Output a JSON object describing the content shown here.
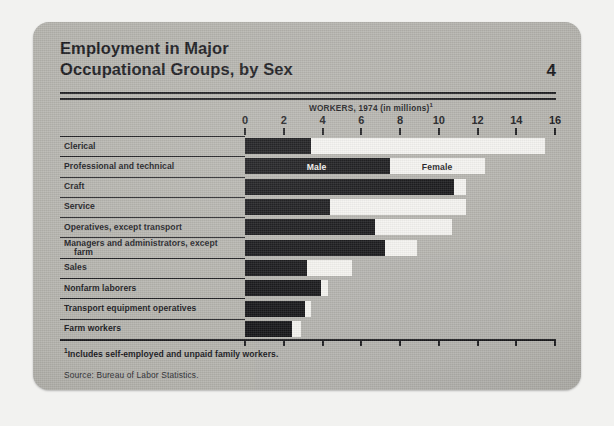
{
  "card": {
    "title_line_1": "Employment in Major",
    "title_line_2": "Occupational Groups, by Sex",
    "page_number": "4",
    "axis_title": "WORKERS, 1974 (in millions)",
    "axis_title_footnote_marker": "1",
    "footnote_marker": "1",
    "footnote": "Includes self-employed and unpaid family workers.",
    "source": "Source:  Bureau of Labor Statistics."
  },
  "colors": {
    "card_background": "#b3b2ad",
    "page_background": "#f2f2f0",
    "ink": "#16161a",
    "male_bar": "#111114",
    "female_bar": "#f4f3ef"
  },
  "chart_data": {
    "type": "bar",
    "orientation": "horizontal",
    "stacked": true,
    "title": "Employment in Major Occupational Groups, by Sex",
    "xlabel": "WORKERS, 1974 (in millions)",
    "ylabel": "",
    "xlim": [
      0,
      16
    ],
    "xticks": [
      0,
      2,
      4,
      6,
      8,
      10,
      12,
      14,
      16
    ],
    "tick_labels": [
      "0",
      "2",
      "4",
      "6",
      "8",
      "10",
      "12",
      "14",
      "16"
    ],
    "grid": false,
    "legend": [
      "Male",
      "Female"
    ],
    "legend_position": "inline-on-bars",
    "legend_row": "Professional and technical",
    "categories": [
      "Clerical",
      "Professional and technical",
      "Craft",
      "Service",
      "Operatives, except transport",
      "Managers and administrators, except farm",
      "Sales",
      "Nonfarm laborers",
      "Transport equipment operatives",
      "Farm workers"
    ],
    "category_lines": [
      [
        "Clerical"
      ],
      [
        "Professional and technical"
      ],
      [
        "Craft"
      ],
      [
        "Service"
      ],
      [
        "Operatives, except transport"
      ],
      [
        "Managers and administrators, except",
        "farm"
      ],
      [
        "Sales"
      ],
      [
        "Nonfarm laborers"
      ],
      [
        "Transport equipment operatives"
      ],
      [
        "Farm workers"
      ]
    ],
    "series": [
      {
        "name": "Male",
        "values": [
          3.4,
          7.5,
          10.8,
          4.4,
          6.7,
          7.2,
          3.2,
          3.9,
          3.1,
          2.4
        ]
      },
      {
        "name": "Female",
        "values": [
          12.1,
          4.9,
          0.6,
          7.0,
          4.0,
          1.7,
          2.3,
          0.4,
          0.3,
          0.5
        ]
      }
    ],
    "totals": [
      15.5,
      12.4,
      11.4,
      11.4,
      10.7,
      8.9,
      5.5,
      4.3,
      3.4,
      2.9
    ]
  }
}
